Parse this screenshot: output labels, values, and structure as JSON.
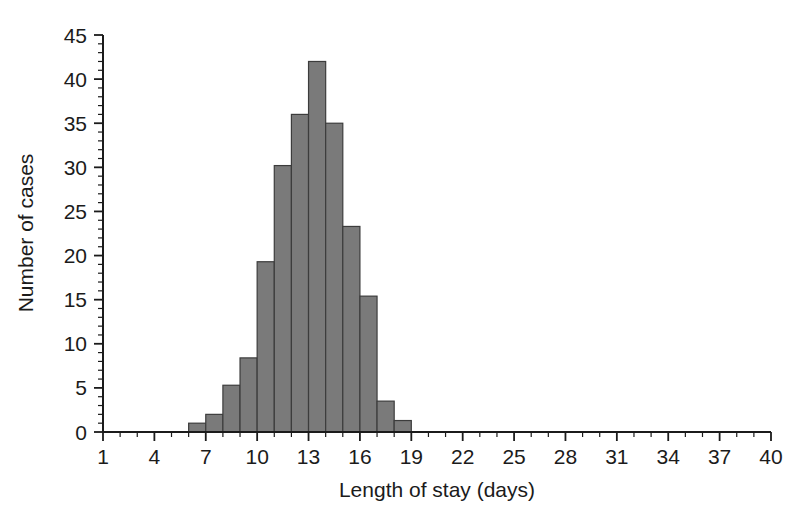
{
  "chart_data": {
    "type": "bar",
    "title": "",
    "subtitle": "",
    "xlabel": "Length of stay (days)",
    "ylabel": "Number of cases",
    "categories": [
      6,
      7,
      8,
      9,
      10,
      11,
      12,
      13,
      14,
      15,
      16,
      17,
      18
    ],
    "values": [
      1,
      2,
      5.3,
      8.4,
      19.3,
      30.2,
      36,
      42,
      35,
      23.3,
      15.4,
      3.5,
      1.3
    ],
    "bin_width": 1,
    "xlim": [
      1,
      40
    ],
    "ylim": [
      0,
      45
    ],
    "x_ticks_major": [
      1,
      4,
      7,
      10,
      13,
      16,
      19,
      22,
      25,
      28,
      31,
      34,
      37,
      40
    ],
    "x_tick_labels": [
      "1",
      "4",
      "7",
      "10",
      "13",
      "16",
      "19",
      "22",
      "25",
      "28",
      "31",
      "34",
      "37",
      "40"
    ],
    "x_minor_tick_step": 1,
    "y_ticks_major": [
      0,
      5,
      10,
      15,
      20,
      25,
      30,
      35,
      40,
      45
    ],
    "y_tick_labels": [
      "0",
      "5",
      "10",
      "15",
      "20",
      "25",
      "30",
      "35",
      "40",
      "45"
    ],
    "y_minor_tick_step": 1,
    "grid": false,
    "legend": null,
    "bar_fill_color": "#7a7a7a",
    "bar_edge_color": "#3c3c3c",
    "axis_color": "#1b1b1b",
    "background_color": "#ffffff"
  }
}
